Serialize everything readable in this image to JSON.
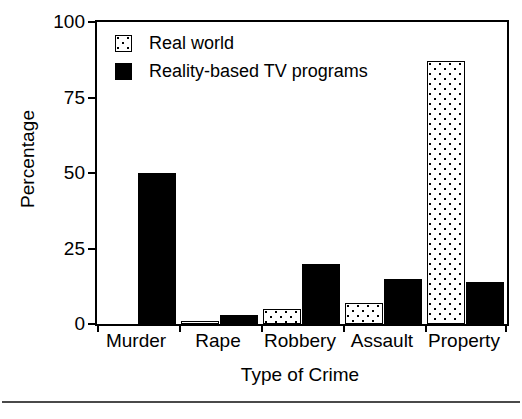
{
  "chart_data": {
    "type": "bar",
    "title": "",
    "xlabel": "Type of Crime",
    "ylabel": "Percentage",
    "categories": [
      "Murder",
      "Rape",
      "Robbery",
      "Assault",
      "Property"
    ],
    "series": [
      {
        "name": "Real world",
        "values": [
          0,
          1,
          5,
          7,
          87
        ],
        "fill": "stipple",
        "color": "#ffffff"
      },
      {
        "name": "Reality-based TV programs",
        "values": [
          50,
          3,
          20,
          15,
          14
        ],
        "fill": "solid",
        "color": "#000000"
      }
    ],
    "ylim": [
      0,
      100
    ],
    "yticks": [
      0,
      25,
      50,
      75,
      100
    ],
    "ytick_labels": [
      "0",
      "25",
      "50",
      "75",
      "100"
    ],
    "grid": false,
    "legend_position": "top-left",
    "frame": "box",
    "axis_color": "#000000"
  }
}
